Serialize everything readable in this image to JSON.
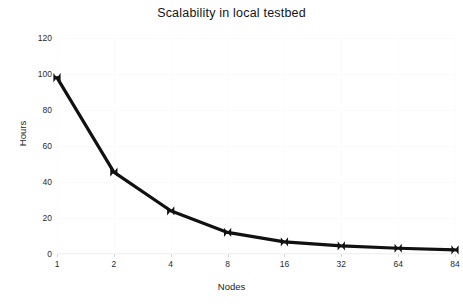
{
  "chart_data": {
    "type": "line",
    "title": "Scalability in local testbed",
    "xlabel": "Nodes",
    "ylabel": "Hours",
    "categories": [
      "1",
      "2",
      "4",
      "8",
      "16",
      "32",
      "64",
      "84"
    ],
    "values": [
      98,
      45.5,
      24,
      12,
      6.7,
      4.5,
      3.2,
      2.3
    ],
    "series": [
      {
        "name": "Hours",
        "values": [
          98,
          45.5,
          24,
          12,
          6.7,
          4.5,
          3.2,
          2.3
        ]
      }
    ],
    "ylim": [
      0,
      120
    ],
    "yticks": [
      0,
      20,
      40,
      60,
      80,
      100,
      120
    ],
    "ytick_labels": [
      "0",
      "20",
      "40",
      "60",
      "80",
      "100",
      "120"
    ],
    "xtick_labels": [
      "1",
      "2",
      "4",
      "8",
      "16",
      "32",
      "64",
      "84"
    ],
    "grid": true,
    "legend": "none",
    "x_scale": "categorical",
    "line_color": "#111111",
    "marker": "bowtie",
    "background_color": "#ffffff"
  }
}
